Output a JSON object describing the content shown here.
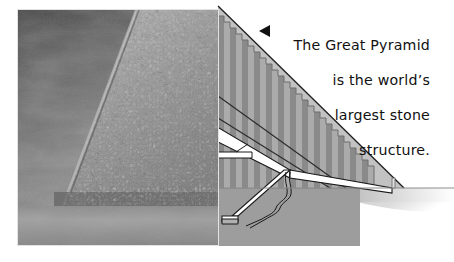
{
  "figure": {
    "kind": "illustrated-diagram-with-photo",
    "caption_lines": [
      "The Great Pyramid",
      "is the world’s",
      "largest stone",
      "structure."
    ],
    "caption_full": "The Great Pyramid is the world’s largest stone structure.",
    "pointer_icon": "left-triangle-icon",
    "pointer_direction": "left"
  },
  "photo": {
    "subject": "Great Pyramid of Giza",
    "description": "Black and white photograph of the weathered stone face of the Great Pyramid rising diagonally against a dark cloudy sky, with desert sand in the foreground.",
    "palette": {
      "sky_dark": "#4a4a4a",
      "sky_mid": "#7b7b7b",
      "sky_light": "#9a9a9a",
      "stone_light": "#b9b9b9",
      "stone_mid": "#8d8d8d",
      "stone_dark": "#5a5a5a",
      "sand": "#8f8f8f",
      "sand_light": "#a6a6a6"
    }
  },
  "diagram": {
    "palette": {
      "casing": "#c2c2c2",
      "core_step_light": "#ababab",
      "core_step_dark": "#8a8a8a",
      "bedrock": "#9d9d9d",
      "ground": "#b4b4b4",
      "passage": "#ffffff",
      "outline": "#1a1a1a",
      "shadow": "#c9c9c9"
    },
    "parts": [
      {
        "name": "outer-casing-slope",
        "label": "Outer casing"
      },
      {
        "name": "stepped-core",
        "label": "Stepped limestone core",
        "step_count": 26
      },
      {
        "name": "grand-gallery",
        "label": "Grand Gallery"
      },
      {
        "name": "kings-chamber-passage",
        "label": "King’s Chamber passage"
      },
      {
        "name": "descending-passage",
        "label": "Descending passage"
      },
      {
        "name": "well-shaft",
        "label": "Well shaft"
      },
      {
        "name": "subterranean-chamber",
        "label": "Subterranean chamber"
      },
      {
        "name": "ground-plane",
        "label": "Desert ground line"
      },
      {
        "name": "base-marker-post",
        "label": "Base marker"
      }
    ]
  }
}
